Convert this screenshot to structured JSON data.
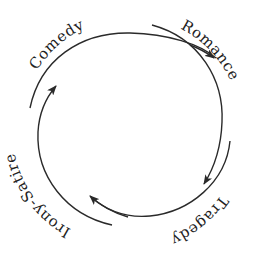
{
  "diagram": {
    "type": "cycle",
    "labels": {
      "comedy": "Comedy",
      "romance": "Romance",
      "tragedy": "Tragedy",
      "irony": "Irony-Satire"
    },
    "order": [
      "Comedy",
      "Romance",
      "Tragedy",
      "Irony-Satire"
    ],
    "arrow_direction": "clockwise",
    "stroke_color": "#2a2a2a"
  }
}
